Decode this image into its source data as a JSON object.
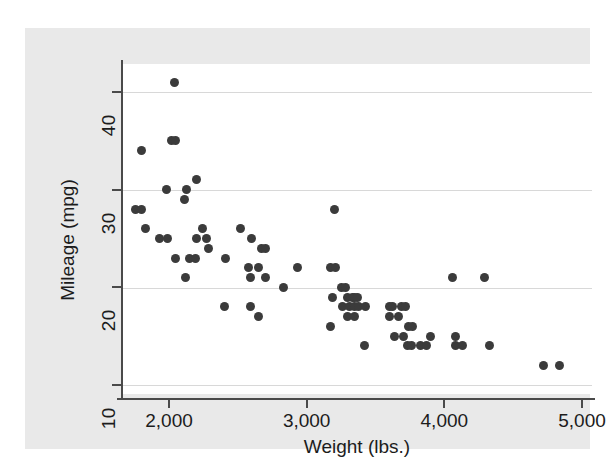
{
  "figure": {
    "background_color": "#e9e9e9",
    "plot_background_color": "#ffffff",
    "marker_color": "#3b3b3b",
    "axis_color": "#4a4a4a",
    "grid_color": "#d8d8d8"
  },
  "chart_data": {
    "type": "scatter",
    "title": "",
    "xlabel": "Weight (lbs.)",
    "ylabel": "Mileage (mpg)",
    "xlim": [
      1660,
      5070
    ],
    "ylim": [
      8.3,
      43.0
    ],
    "xticks": [
      2000,
      3000,
      4000,
      5000
    ],
    "xtick_labels": [
      "2,000",
      "3,000",
      "4,000",
      "5,000"
    ],
    "yticks": [
      10,
      20,
      30,
      40
    ],
    "ytick_labels": [
      "10",
      "20",
      "30",
      "40"
    ],
    "grid": "horizontal",
    "legend": "none",
    "series": [
      {
        "name": "Mileage vs Weight",
        "marker": "filled-circle",
        "points": [
          [
            2040,
            41
          ],
          [
            2020,
            35
          ],
          [
            2050,
            35
          ],
          [
            1800,
            34
          ],
          [
            1980,
            30
          ],
          [
            2130,
            30
          ],
          [
            2110,
            29
          ],
          [
            2200,
            31
          ],
          [
            1760,
            28
          ],
          [
            1800,
            28
          ],
          [
            1830,
            26
          ],
          [
            1930,
            25
          ],
          [
            1990,
            25
          ],
          [
            2240,
            26
          ],
          [
            2200,
            25
          ],
          [
            2270,
            25
          ],
          [
            2290,
            24
          ],
          [
            2050,
            23
          ],
          [
            2150,
            23
          ],
          [
            2190,
            23
          ],
          [
            2410,
            23
          ],
          [
            2120,
            21
          ],
          [
            2520,
            26
          ],
          [
            2600,
            25
          ],
          [
            2670,
            24
          ],
          [
            2700,
            24
          ],
          [
            2580,
            22
          ],
          [
            2590,
            21
          ],
          [
            2650,
            22
          ],
          [
            2700,
            21
          ],
          [
            2830,
            20
          ],
          [
            2930,
            22
          ],
          [
            2400,
            18
          ],
          [
            2590,
            18
          ],
          [
            2650,
            17
          ],
          [
            3200,
            28
          ],
          [
            3170,
            22
          ],
          [
            3210,
            22
          ],
          [
            3250,
            20
          ],
          [
            3280,
            20
          ],
          [
            3190,
            19
          ],
          [
            3300,
            19
          ],
          [
            3330,
            19
          ],
          [
            3350,
            19
          ],
          [
            3370,
            19
          ],
          [
            3260,
            18
          ],
          [
            3310,
            18
          ],
          [
            3350,
            18
          ],
          [
            3380,
            18
          ],
          [
            3430,
            18
          ],
          [
            3300,
            17
          ],
          [
            3350,
            17
          ],
          [
            3170,
            16
          ],
          [
            3420,
            14
          ],
          [
            3600,
            18
          ],
          [
            3620,
            18
          ],
          [
            3690,
            18
          ],
          [
            3720,
            18
          ],
          [
            3600,
            17
          ],
          [
            3670,
            17
          ],
          [
            3740,
            16
          ],
          [
            3770,
            16
          ],
          [
            3640,
            15
          ],
          [
            3700,
            15
          ],
          [
            3730,
            14
          ],
          [
            3760,
            14
          ],
          [
            3830,
            14
          ],
          [
            3870,
            14
          ],
          [
            3900,
            15
          ],
          [
            4060,
            21
          ],
          [
            4080,
            15
          ],
          [
            4080,
            14
          ],
          [
            4130,
            14
          ],
          [
            4290,
            21
          ],
          [
            4330,
            14
          ],
          [
            4720,
            12
          ],
          [
            4840,
            12
          ]
        ]
      }
    ]
  }
}
